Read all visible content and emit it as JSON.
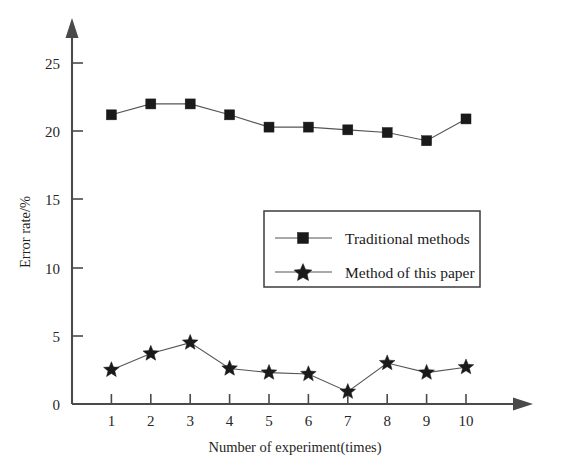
{
  "chart_data": {
    "type": "line",
    "title": "",
    "xlabel": "Number of experiment(times)",
    "ylabel": "Error rate/%",
    "categories": [
      "1",
      "2",
      "3",
      "4",
      "5",
      "6",
      "7",
      "8",
      "9",
      "10"
    ],
    "x": [
      1,
      2,
      3,
      4,
      5,
      6,
      7,
      8,
      9,
      10
    ],
    "xlim": [
      0,
      10.6
    ],
    "ylim": [
      0,
      26.5
    ],
    "xticks": [
      1,
      2,
      3,
      4,
      5,
      6,
      7,
      8,
      9,
      10
    ],
    "yticks": [
      0,
      5,
      10,
      15,
      20,
      25
    ],
    "ytick_labels": [
      "0",
      "5",
      "10",
      "15",
      "20",
      "25"
    ],
    "grid": false,
    "legend_position": "center-right",
    "series": [
      {
        "name": "Traditional methods",
        "marker": "square",
        "color": "#1a1a1a",
        "values": [
          21.2,
          22.0,
          22.0,
          21.2,
          20.3,
          20.3,
          20.1,
          19.9,
          19.3,
          20.9
        ]
      },
      {
        "name": "Method of this paper",
        "marker": "star",
        "color": "#1a1a1a",
        "values": [
          2.5,
          3.7,
          4.5,
          2.6,
          2.3,
          2.2,
          0.9,
          3.0,
          2.3,
          2.7
        ]
      }
    ]
  },
  "axes": {
    "y_axis_title": "Error rate/%",
    "x_axis_title": "Number of experiment(times)",
    "y_arrow": "up-arrow-icon",
    "x_arrow": "right-arrow-icon"
  },
  "legend": {
    "entries": [
      {
        "label": "Traditional methods",
        "marker": "square-marker-icon"
      },
      {
        "label": "Method of this paper",
        "marker": "star-marker-icon"
      }
    ]
  }
}
